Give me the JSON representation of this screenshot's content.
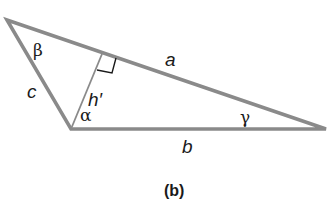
{
  "figure": {
    "caption": "(b)",
    "colors": {
      "stroke": "#8a8a8a",
      "text": "#1a1a1a",
      "background": "#ffffff"
    },
    "vertices": {
      "top_left": [
        7,
        20
      ],
      "bottom_left": [
        71,
        129
      ],
      "right": [
        326,
        129
      ]
    },
    "altitude_foot": [
      102,
      54
    ],
    "sides": {
      "a": "a",
      "b": "b",
      "c": "c"
    },
    "angles": {
      "alpha": "α",
      "beta": "β",
      "gamma": "γ"
    },
    "altitude_label": "h′"
  }
}
